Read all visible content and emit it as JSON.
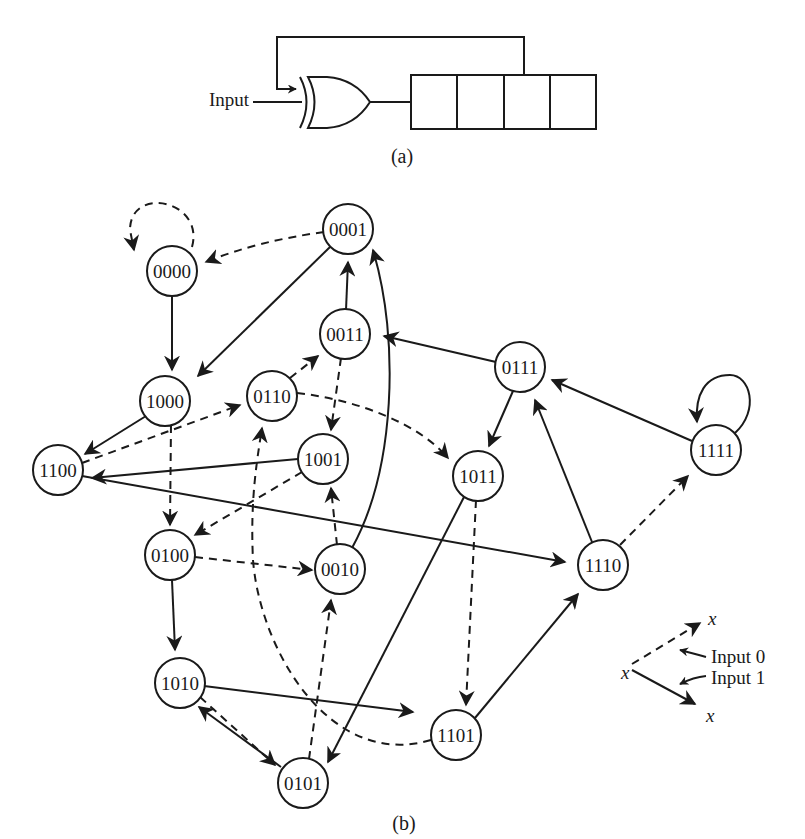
{
  "part_a": {
    "caption": "(a)",
    "input_label": "Input",
    "register_cells": 4,
    "gate": "XOR",
    "feedback_from_cell_boundary": 3
  },
  "part_b": {
    "caption": "(b)",
    "legend": {
      "node_symbol": "x",
      "input0_label": "Input 0",
      "input1_label": "Input 1",
      "input0_style": "dashed",
      "input1_style": "solid"
    },
    "nodes": [
      {
        "id": "0000",
        "x": 172,
        "y": 271
      },
      {
        "id": "0001",
        "x": 348,
        "y": 229
      },
      {
        "id": "0011",
        "x": 345,
        "y": 334
      },
      {
        "id": "0111",
        "x": 520,
        "y": 367
      },
      {
        "id": "1000",
        "x": 165,
        "y": 401
      },
      {
        "id": "0110",
        "x": 272,
        "y": 396
      },
      {
        "id": "1001",
        "x": 323,
        "y": 459
      },
      {
        "id": "1011",
        "x": 478,
        "y": 476
      },
      {
        "id": "1111",
        "x": 716,
        "y": 450
      },
      {
        "id": "1100",
        "x": 58,
        "y": 470
      },
      {
        "id": "0100",
        "x": 170,
        "y": 555
      },
      {
        "id": "0010",
        "x": 340,
        "y": 569
      },
      {
        "id": "1110",
        "x": 603,
        "y": 565
      },
      {
        "id": "1010",
        "x": 180,
        "y": 683
      },
      {
        "id": "1101",
        "x": 456,
        "y": 735
      },
      {
        "id": "0101",
        "x": 303,
        "y": 783
      }
    ],
    "edges": [
      {
        "from": "0000",
        "to": "0000",
        "input": 0
      },
      {
        "from": "0000",
        "to": "1000",
        "input": 1
      },
      {
        "from": "0001",
        "to": "0000",
        "input": 0
      },
      {
        "from": "0001",
        "to": "1000",
        "input": 1
      },
      {
        "from": "0011",
        "to": "0001",
        "input": 1
      },
      {
        "from": "0011",
        "to": "1001",
        "input": 0
      },
      {
        "from": "0111",
        "to": "0011",
        "input": 1
      },
      {
        "from": "0111",
        "to": "1011",
        "input": 1
      },
      {
        "from": "1000",
        "to": "1100",
        "input": 1
      },
      {
        "from": "1000",
        "to": "0100",
        "input": 0
      },
      {
        "from": "0110",
        "to": "0011",
        "input": 0
      },
      {
        "from": "0110",
        "to": "1011",
        "input": 0
      },
      {
        "from": "1001",
        "to": "1100",
        "input": 1
      },
      {
        "from": "1001",
        "to": "0100",
        "input": 0
      },
      {
        "from": "1011",
        "to": "0101",
        "input": 1
      },
      {
        "from": "1011",
        "to": "1101",
        "input": 0
      },
      {
        "from": "1111",
        "to": "1111",
        "input": 1
      },
      {
        "from": "1111",
        "to": "0111",
        "input": 1
      },
      {
        "from": "1100",
        "to": "0110",
        "input": 0
      },
      {
        "from": "1100",
        "to": "1110",
        "input": 1
      },
      {
        "from": "0100",
        "to": "0010",
        "input": 0
      },
      {
        "from": "0100",
        "to": "1010",
        "input": 1
      },
      {
        "from": "0010",
        "to": "1001",
        "input": 0
      },
      {
        "from": "0010",
        "to": "0001",
        "input": 1
      },
      {
        "from": "1110",
        "to": "0111",
        "input": 1
      },
      {
        "from": "1110",
        "to": "1111",
        "input": 0
      },
      {
        "from": "1010",
        "to": "1101",
        "input": 1
      },
      {
        "from": "1010",
        "to": "0101",
        "input": 0
      },
      {
        "from": "1101",
        "to": "1110",
        "input": 1
      },
      {
        "from": "1101",
        "to": "0110",
        "input": 0
      },
      {
        "from": "0101",
        "to": "1010",
        "input": 1
      },
      {
        "from": "0101",
        "to": "0010",
        "input": 0
      }
    ]
  }
}
